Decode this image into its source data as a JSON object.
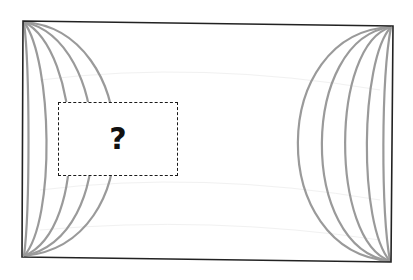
{
  "diagram": {
    "frame": {
      "corners": {
        "tl": [
          23,
          21
        ],
        "tr": [
          393,
          26
        ],
        "br": [
          391,
          262
        ],
        "bl": [
          22,
          257
        ]
      },
      "stroke_color": "#222222"
    },
    "curve_color": "#9a9a9a",
    "left_curves": {
      "count": 5,
      "mid_x": [
        29,
        52,
        81,
        110,
        136
      ]
    },
    "right_curves": {
      "count": 5,
      "mid_x": [
        277,
        304,
        333,
        362,
        383
      ]
    },
    "missing_piece": {
      "label": "?",
      "box_style": "dashed",
      "box_color": "#1a1a1a"
    }
  }
}
